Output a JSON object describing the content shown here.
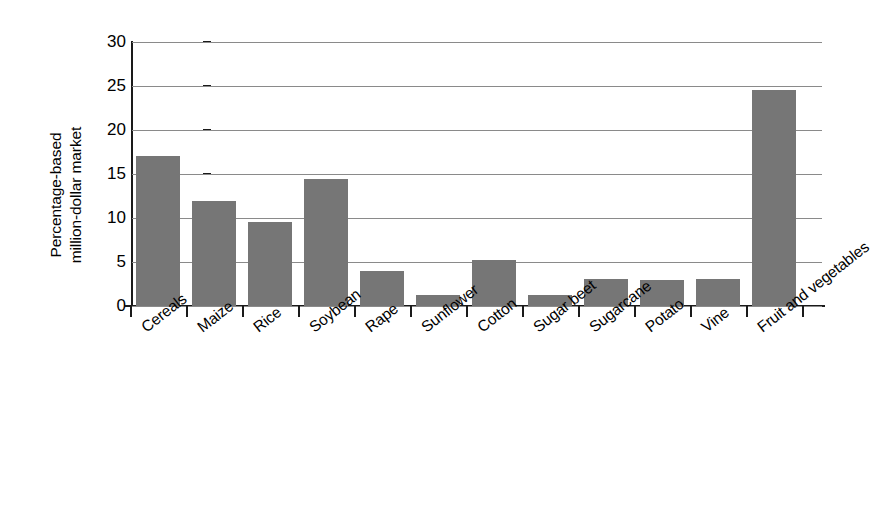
{
  "chart_data": {
    "type": "bar",
    "title": "",
    "xlabel": "",
    "ylabel": "Percentage-based million-dollar market",
    "ylabel_line1": "Percentage-based",
    "ylabel_line2": "million-dollar market",
    "categories": [
      "Cereals",
      "Maize",
      "Rice",
      "Soybean",
      "Rape",
      "Sunflower",
      "Cotton",
      "Sugar beet",
      "Sugarcane",
      "Potato",
      "Vine",
      "Fruit and vegetables"
    ],
    "values": [
      17.1,
      11.9,
      9.6,
      14.4,
      4.0,
      1.2,
      5.2,
      1.3,
      3.1,
      2.9,
      3.1,
      24.5
    ],
    "ylim": [
      0,
      30
    ],
    "yticks": [
      0,
      5,
      10,
      15,
      20,
      25,
      30
    ],
    "ytick_labels": [
      "0",
      "5",
      "10",
      "15",
      "20",
      "25",
      "30"
    ],
    "grid": true,
    "legend": false,
    "bar_color": "#767676",
    "axis_color": "#1a1a1a",
    "gridline_color": "#8a8a8a",
    "background": "#ffffff"
  }
}
